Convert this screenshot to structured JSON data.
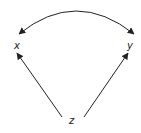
{
  "diagram": {
    "type": "causal-dag",
    "nodes": [
      {
        "id": "x",
        "label": "x"
      },
      {
        "id": "y",
        "label": "y"
      },
      {
        "id": "z",
        "label": "z"
      }
    ],
    "edges": [
      {
        "from": "z",
        "to": "x",
        "style": "directed"
      },
      {
        "from": "z",
        "to": "y",
        "style": "directed"
      },
      {
        "from": "x",
        "to": "y",
        "style": "bidirected-curved"
      }
    ],
    "colors": {
      "stroke": "#222222",
      "background": "#ffffff"
    }
  }
}
